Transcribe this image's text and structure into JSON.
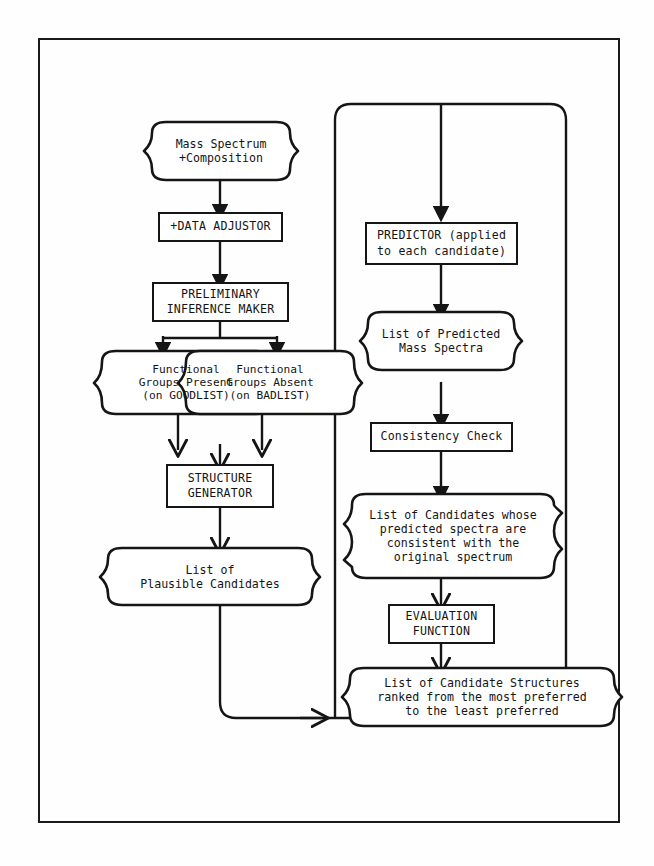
{
  "diagram": {
    "line_color": "#151515",
    "background": "#fefefe"
  },
  "nodes": {
    "mass_spectrum": {
      "shape": "wavy",
      "lines": [
        "Mass Spectrum",
        "+Composition"
      ]
    },
    "data_adjustor": {
      "shape": "rect",
      "lines": [
        "+DATA ADJUSTOR"
      ]
    },
    "preliminary_inference": {
      "shape": "rect",
      "lines": [
        "PRELIMINARY",
        "INFERENCE MAKER"
      ]
    },
    "groups_present": {
      "shape": "wavy",
      "lines": [
        "Functional",
        "Groups Present",
        "(on GOODLIST)"
      ]
    },
    "groups_absent": {
      "shape": "wavy",
      "lines": [
        "Functional",
        "Groups Absent",
        "(on BADLIST)"
      ]
    },
    "structure_generator": {
      "shape": "rect",
      "lines": [
        "STRUCTURE",
        "GENERATOR"
      ]
    },
    "plausible_candidates": {
      "shape": "wavy",
      "lines": [
        "List of",
        "Plausible Candidates"
      ]
    },
    "predictor": {
      "shape": "rect",
      "lines": [
        "PREDICTOR (applied",
        "to each candidate)"
      ]
    },
    "predicted_spectra": {
      "shape": "wavy",
      "lines": [
        "List of Predicted",
        "Mass Spectra"
      ]
    },
    "consistency_check": {
      "shape": "rect",
      "lines": [
        "Consistency Check"
      ]
    },
    "consistent_candidates": {
      "shape": "wavy",
      "lines": [
        "List of Candidates whose",
        "predicted spectra are",
        "consistent with the",
        "original spectrum"
      ]
    },
    "evaluation_function": {
      "shape": "rect",
      "lines": [
        "EVALUATION",
        "FUNCTION"
      ]
    },
    "ranked_structures": {
      "shape": "wavy",
      "lines": [
        "List of Candidate Structures",
        "ranked from the most preferred",
        "to the least preferred"
      ]
    }
  }
}
